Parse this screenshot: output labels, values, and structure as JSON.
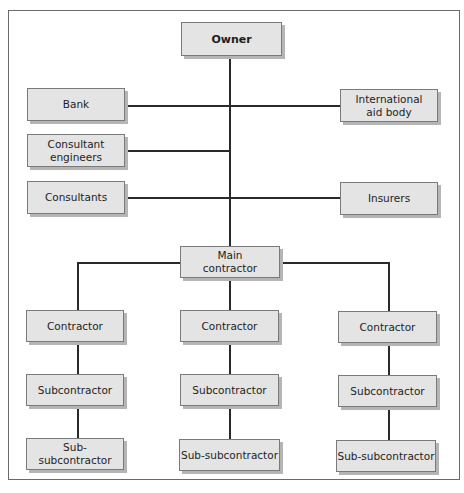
{
  "diagram": {
    "type": "organization-chart",
    "nodes": {
      "owner": "Owner",
      "bank": "Bank",
      "international_aid_body": "International\naid body",
      "consultant_engineers": "Consultant\nengineers",
      "consultants": "Consultants",
      "insurers": "Insurers",
      "main_contractor": "Main\ncontractor",
      "branches": [
        {
          "contractor": "Contractor",
          "subcontractor": "Subcontractor",
          "sub_subcontractor": "Sub-subcontractor"
        },
        {
          "contractor": "Contractor",
          "subcontractor": "Subcontractor",
          "sub_subcontractor": "Sub-subcontractor"
        },
        {
          "contractor": "Contractor",
          "subcontractor": "Subcontractor",
          "sub_subcontractor": "Sub-subcontractor"
        }
      ]
    },
    "edges": [
      [
        "Owner",
        "Main contractor"
      ],
      [
        "Bank",
        "International aid body"
      ],
      [
        "Consultant engineers",
        "Owner-Main contractor line"
      ],
      [
        "Consultants",
        "Insurers"
      ],
      [
        "Main contractor",
        "Contractor (left)"
      ],
      [
        "Main contractor",
        "Contractor (middle)"
      ],
      [
        "Main contractor",
        "Contractor (right)"
      ],
      [
        "Contractor",
        "Subcontractor"
      ],
      [
        "Subcontractor",
        "Sub-subcontractor"
      ]
    ],
    "colors": {
      "box_fill": "#e4e4e4",
      "box_border": "#7a7a7a",
      "box_shadow": "#b5b5b5",
      "line": "#2a2a2a"
    }
  }
}
